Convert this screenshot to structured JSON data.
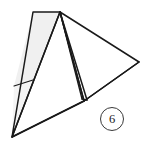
{
  "figure": {
    "caption_number": "6",
    "background_color": "#ffffff",
    "stroke_color": "#1a1a1a",
    "shade_fill": "#f0f0f0",
    "shade_fill_light": "#f7f7f7",
    "circle_label": {
      "text": "6",
      "x": 100,
      "y": 107,
      "diameter": 24,
      "border_color": "#3a3a3a"
    },
    "canvas": {
      "width": 151,
      "height": 147
    },
    "vertices": {
      "apex_left": {
        "x": 33,
        "y": 12
      },
      "apex_right": {
        "x": 60,
        "y": 12
      },
      "bottom_left": {
        "x": 12,
        "y": 137
      },
      "base_notch": {
        "x": 84,
        "y": 101
      },
      "right_vertex": {
        "x": 139,
        "y": 62
      },
      "shade_left_mid": {
        "x": 14,
        "y": 86
      },
      "shade_right_mid": {
        "x": 33,
        "y": 80
      },
      "sliver_inner": {
        "x": 82,
        "y": 99
      },
      "sliver_outer": {
        "x": 87,
        "y": 100
      }
    },
    "shapes": [
      {
        "name": "shaded-wedge-upper",
        "type": "polygon",
        "fill": "#f0f0f0",
        "points": "33,12 60,12 33,80 14,86"
      },
      {
        "name": "shaded-wedge-lower",
        "type": "polygon",
        "fill": "#f4f4f4",
        "points": "14,86 33,80 12,137"
      },
      {
        "name": "large-right-triangle",
        "type": "polygon",
        "fill": "none",
        "points": "60,12 139,62 84,101"
      },
      {
        "name": "narrow-sliver",
        "type": "polygon",
        "fill": "#fbfbfb",
        "points": "60,12 87,100 82,99"
      },
      {
        "name": "base-triangle",
        "type": "polygon",
        "fill": "none",
        "points": "60,12 84,101 12,137"
      }
    ],
    "lines": [
      {
        "name": "crease-line",
        "x1": 14,
        "y1": 86,
        "x2": 33,
        "y2": 80
      },
      {
        "name": "left-edge",
        "x1": 33,
        "y1": 12,
        "x2": 12,
        "y2": 137
      },
      {
        "name": "base-edge",
        "x1": 12,
        "y1": 137,
        "x2": 84,
        "y2": 101
      },
      {
        "name": "right-base-edge",
        "x1": 84,
        "y1": 101,
        "x2": 139,
        "y2": 62
      }
    ]
  }
}
